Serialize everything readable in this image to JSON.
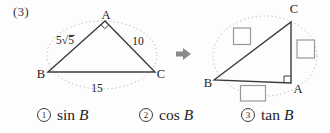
{
  "problem": {
    "number_label": "(3)",
    "left_triangle": {
      "vertex_a": "A",
      "vertex_b": "B",
      "vertex_c": "C",
      "side_ab": "5√5",
      "side_ac": "10",
      "side_bc": "15",
      "right_angle_at": "A"
    },
    "right_triangle": {
      "vertex_a": "A",
      "vertex_b": "B",
      "vertex_c": "C",
      "right_angle_at": "A",
      "answer_boxes": [
        "",
        "",
        ""
      ]
    },
    "options": [
      {
        "num": "1",
        "func": "sin",
        "variable": "B"
      },
      {
        "num": "2",
        "func": "cos",
        "variable": "B"
      },
      {
        "num": "3",
        "func": "tan",
        "variable": "B"
      }
    ],
    "colors": {
      "line": "#3b3b3b",
      "dotted_outline": "#b3b3b3",
      "answer_box_border": "#999999",
      "arrow": "#8a8a8a",
      "text": "#222222"
    }
  }
}
